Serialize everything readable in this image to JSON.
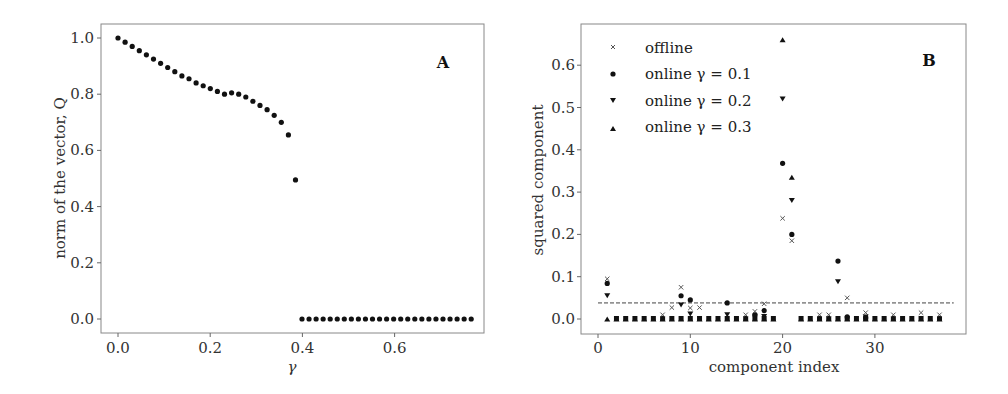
{
  "chart_data": [
    {
      "type": "scatter",
      "panel_label": "A",
      "title": "",
      "xlabel": "γ",
      "ylabel": "norm of the vector, Q",
      "xlim": [
        -0.035,
        0.785
      ],
      "ylim": [
        -0.05,
        1.05
      ],
      "xticks": [
        "0.0",
        "0.2",
        "0.4",
        "0.6"
      ],
      "xtick_values": [
        0.0,
        0.2,
        0.4,
        0.6
      ],
      "yticks": [
        "0.0",
        "0.2",
        "0.4",
        "0.6",
        "0.8",
        "1.0"
      ],
      "ytick_values": [
        0.0,
        0.2,
        0.4,
        0.6,
        0.8,
        1.0
      ],
      "grid": false,
      "x": [
        0.0,
        0.025,
        0.05,
        0.075,
        0.1,
        0.125,
        0.15,
        0.175,
        0.2,
        0.225,
        0.25,
        0.275,
        0.3,
        0.325,
        0.35,
        0.375,
        0.4,
        0.425,
        0.45,
        0.475,
        0.5,
        0.525,
        0.55,
        0.575,
        0.6,
        0.625,
        0.65,
        0.675,
        0.7,
        0.725,
        0.75
      ],
      "x_dense": true,
      "series": [
        {
          "name": "Q",
          "marker": "circle",
          "points": [
            [
              0.0,
              1.0
            ],
            [
              0.0125,
              0.985
            ],
            [
              0.025,
              0.97
            ],
            [
              0.0375,
              0.955
            ],
            [
              0.05,
              0.94
            ],
            [
              0.0625,
              0.925
            ],
            [
              0.075,
              0.91
            ],
            [
              0.0875,
              0.895
            ],
            [
              0.1,
              0.88
            ],
            [
              0.1125,
              0.865
            ],
            [
              0.125,
              0.855
            ],
            [
              0.1375,
              0.84
            ],
            [
              0.15,
              0.83
            ],
            [
              0.1625,
              0.82
            ],
            [
              0.175,
              0.81
            ],
            [
              0.1875,
              0.8
            ],
            [
              0.2,
              0.805
            ],
            [
              0.2125,
              0.8
            ],
            [
              0.225,
              0.79
            ],
            [
              0.2375,
              0.775
            ],
            [
              0.25,
              0.76
            ],
            [
              0.2625,
              0.745
            ],
            [
              0.275,
              0.725
            ],
            [
              0.2875,
              0.7
            ],
            [
              0.3,
              0.655
            ],
            [
              0.3125,
              0.495
            ]
          ]
        },
        {
          "name": "Q_zero",
          "marker": "circle",
          "points": [
            [
              0.325,
              0.0
            ],
            [
              0.3375,
              0.0
            ],
            [
              0.35,
              0.0
            ],
            [
              0.3625,
              0.0
            ],
            [
              0.375,
              0.0
            ],
            [
              0.3875,
              0.0
            ],
            [
              0.4,
              0.0
            ],
            [
              0.4125,
              0.0
            ],
            [
              0.425,
              0.0
            ],
            [
              0.4375,
              0.0
            ],
            [
              0.45,
              0.0
            ],
            [
              0.4625,
              0.0
            ],
            [
              0.475,
              0.0
            ],
            [
              0.4875,
              0.0
            ],
            [
              0.5,
              0.0
            ],
            [
              0.5125,
              0.0
            ],
            [
              0.525,
              0.0
            ],
            [
              0.5375,
              0.0
            ],
            [
              0.55,
              0.0
            ],
            [
              0.5625,
              0.0
            ],
            [
              0.575,
              0.0
            ],
            [
              0.5875,
              0.0
            ],
            [
              0.6,
              0.0
            ],
            [
              0.6125,
              0.0
            ],
            [
              0.625,
              0.0
            ]
          ]
        }
      ]
    },
    {
      "type": "scatter",
      "panel_label": "B",
      "title": "",
      "xlabel": "component index",
      "ylabel": "squared component",
      "xlim": [
        -2,
        40
      ],
      "ylim": [
        -0.033,
        0.69
      ],
      "xticks": [
        "0",
        "10",
        "20",
        "30"
      ],
      "xtick_values": [
        0,
        10,
        20,
        30
      ],
      "yticks": [
        "0.0",
        "0.1",
        "0.2",
        "0.3",
        "0.4",
        "0.5",
        "0.6"
      ],
      "ytick_values": [
        0.0,
        0.1,
        0.2,
        0.3,
        0.4,
        0.5,
        0.6
      ],
      "grid": false,
      "legend": {
        "position": "upper left",
        "entries": [
          {
            "label": "offline",
            "marker": "x"
          },
          {
            "label": "online γ = 0.1",
            "marker": "circle"
          },
          {
            "label": "online γ = 0.2",
            "marker": "triangle-down"
          },
          {
            "label": "online γ = 0.3",
            "marker": "triangle-up"
          }
        ]
      },
      "annotations": [
        {
          "type": "hline",
          "y": 0.038,
          "style": "dashed",
          "x_range": [
            0,
            38
          ]
        }
      ],
      "series": [
        {
          "name": "offline",
          "marker": "x",
          "points": [
            [
              1,
              0.095
            ],
            [
              7,
              0.01
            ],
            [
              8,
              0.027
            ],
            [
              9,
              0.075
            ],
            [
              10,
              0.026
            ],
            [
              11,
              0.027
            ],
            [
              16,
              0.01
            ],
            [
              17,
              0.018
            ],
            [
              18,
              0.036
            ],
            [
              20,
              0.238
            ],
            [
              21,
              0.185
            ],
            [
              24,
              0.01
            ],
            [
              25,
              0.01
            ],
            [
              27,
              0.05
            ],
            [
              29,
              0.015
            ],
            [
              32,
              0.01
            ],
            [
              35,
              0.015
            ],
            [
              37,
              0.01
            ]
          ]
        },
        {
          "name": "online γ = 0.1",
          "marker": "circle",
          "points": [
            [
              1,
              0.084
            ],
            [
              9,
              0.055
            ],
            [
              10,
              0.045
            ],
            [
              14,
              0.038
            ],
            [
              17,
              0.01
            ],
            [
              18,
              0.02
            ],
            [
              20,
              0.368
            ],
            [
              21,
              0.2
            ],
            [
              26,
              0.137
            ],
            [
              27,
              0.005
            ],
            [
              29,
              0.003
            ]
          ]
        },
        {
          "name": "online γ = 0.2",
          "marker": "triangle-down",
          "points": [
            [
              1,
              0.055
            ],
            [
              9,
              0.033
            ],
            [
              10,
              0.012
            ],
            [
              14,
              0.01
            ],
            [
              17,
              0.005
            ],
            [
              18,
              0.006
            ],
            [
              20,
              0.52
            ],
            [
              21,
              0.28
            ],
            [
              26,
              0.088
            ],
            [
              29,
              0.005
            ]
          ]
        },
        {
          "name": "online γ = 0.3",
          "marker": "triangle-up",
          "points": [
            [
              1,
              0.0
            ],
            [
              2,
              0.0
            ],
            [
              3,
              0.0
            ],
            [
              4,
              0.0
            ],
            [
              5,
              0.0
            ],
            [
              6,
              0.0
            ],
            [
              7,
              0.0
            ],
            [
              8,
              0.0
            ],
            [
              9,
              0.0
            ],
            [
              10,
              0.0
            ],
            [
              11,
              0.0
            ],
            [
              12,
              0.0
            ],
            [
              13,
              0.0
            ],
            [
              14,
              0.0
            ],
            [
              15,
              0.0
            ],
            [
              16,
              0.0
            ],
            [
              17,
              0.0
            ],
            [
              18,
              0.0
            ],
            [
              19,
              0.0
            ],
            [
              20,
              0.66
            ],
            [
              21,
              0.335
            ],
            [
              22,
              0.0
            ],
            [
              23,
              0.0
            ],
            [
              24,
              0.0
            ],
            [
              25,
              0.0
            ],
            [
              26,
              0.0
            ],
            [
              27,
              0.0
            ],
            [
              28,
              0.0
            ],
            [
              29,
              0.0
            ],
            [
              30,
              0.0
            ],
            [
              31,
              0.0
            ],
            [
              32,
              0.0
            ],
            [
              33,
              0.0
            ],
            [
              34,
              0.0
            ],
            [
              35,
              0.0
            ],
            [
              36,
              0.0
            ],
            [
              37,
              0.0
            ]
          ]
        }
      ]
    }
  ],
  "panels": {
    "a": {
      "label": "A",
      "xlabel": "γ",
      "ylabel": "norm of the vector, Q",
      "xticks": [
        "0.0",
        "0.2",
        "0.4",
        "0.6"
      ],
      "yticks": [
        "0.0",
        "0.2",
        "0.4",
        "0.6",
        "0.8",
        "1.0"
      ]
    },
    "b": {
      "label": "B",
      "xlabel": "component index",
      "ylabel": "squared component",
      "xticks": [
        "0",
        "10",
        "20",
        "30"
      ],
      "yticks": [
        "0.0",
        "0.1",
        "0.2",
        "0.3",
        "0.4",
        "0.5",
        "0.6"
      ],
      "legend": [
        "offline",
        "online γ = 0.1",
        "online γ = 0.2",
        "online γ = 0.3"
      ]
    }
  }
}
